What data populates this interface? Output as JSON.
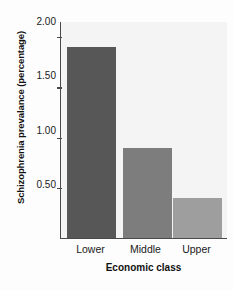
{
  "chart_data": {
    "type": "bar",
    "title": "",
    "subtitle": "",
    "categories": [
      "Lower",
      "Middle",
      "Upper"
    ],
    "values": [
      1.9,
      0.9,
      0.4
    ],
    "xlabel": "Economic class",
    "ylabel": "Schizophrenia prevalance (percentage)",
    "ylim": [
      0,
      2.15
    ],
    "yticks": [
      0.5,
      1.0,
      1.5,
      2.0
    ],
    "ytick_labels": [
      "0.50",
      "1.00",
      "1.50",
      "2.00"
    ],
    "grid": false,
    "legend": false,
    "bar_colors": [
      "#575757",
      "#7d7d7d",
      "#9e9e9e"
    ],
    "axis_color": "#4a4a4a",
    "plot_background": "#f4f4f4",
    "figure_background": "#fdfdfd"
  },
  "axes": {
    "y_title": "Schizophrenia prevalance (percentage)",
    "x_title": "Economic class",
    "ytick_0": "0.50",
    "ytick_1": "1.00",
    "ytick_2": "1.50",
    "ytick_3": "2.00",
    "xtick_0": "Lower",
    "xtick_1": "Middle",
    "xtick_2": "Upper"
  }
}
